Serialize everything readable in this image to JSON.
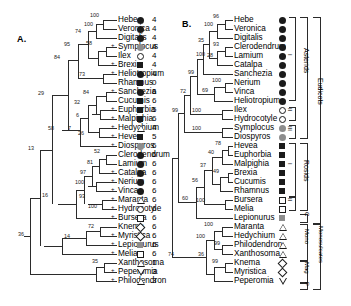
{
  "figure": {
    "panels": [
      {
        "id": "A",
        "label": "A."
      },
      {
        "id": "B",
        "label": "B."
      }
    ]
  },
  "panelA": {
    "label": "A.",
    "taxa": [
      {
        "name": "Hebe",
        "symbol": "filled-circle",
        "code": "4"
      },
      {
        "name": "Veronica",
        "symbol": "filled-circle",
        "code": "4"
      },
      {
        "name": "Digitalis",
        "symbol": "filled-circle",
        "code": "4"
      },
      {
        "name": "Symplocus",
        "symbol": "gray-circle",
        "code": "4"
      },
      {
        "name": "Ilex",
        "symbol": "open-circle",
        "code": "4"
      },
      {
        "name": "Brexia",
        "symbol": "filled-square",
        "code": "4"
      },
      {
        "name": "Heliotropium",
        "symbol": "filled-circle",
        "code": "4"
      },
      {
        "name": "Rhamnus",
        "symbol": "filled-square",
        "code": "0"
      },
      {
        "name": "Sanchezia",
        "symbol": "filled-circle",
        "code": "6"
      },
      {
        "name": "Cucumis",
        "symbol": "filled-square",
        "code": "6"
      },
      {
        "name": "Euphorbia",
        "symbol": "filled-square",
        "code": "5"
      },
      {
        "name": "Malpighia",
        "symbol": "filled-square",
        "code": "6"
      },
      {
        "name": "Hedychium",
        "symbol": "up-triangle",
        "code": "4"
      },
      {
        "name": "Hevea",
        "symbol": "filled-square",
        "code": "5"
      },
      {
        "name": "Diospyros",
        "symbol": "gray-circle",
        "code": "6"
      },
      {
        "name": "Clerodendrum",
        "symbol": "filled-circle",
        "code": "6"
      },
      {
        "name": "Lamium",
        "symbol": "filled-circle",
        "code": "6"
      },
      {
        "name": "Catalpa",
        "symbol": "filled-circle",
        "code": "6"
      },
      {
        "name": "Nerium",
        "symbol": "filled-circle",
        "code": "6"
      },
      {
        "name": "Vinca",
        "symbol": "filled-circle",
        "code": "6"
      },
      {
        "name": "Maranta",
        "symbol": "up-triangle",
        "code": "6"
      },
      {
        "name": "Hydrocotyle",
        "symbol": "open-circle",
        "code": "6"
      },
      {
        "name": "Bursera",
        "symbol": "open-square",
        "code": "6"
      },
      {
        "name": "Knema",
        "symbol": "diamond",
        "code": "6"
      },
      {
        "name": "Myristica",
        "symbol": "diamond",
        "code": "6"
      },
      {
        "name": "Lepionurus",
        "symbol": "gray-square",
        "code": "6"
      },
      {
        "name": "Melia",
        "symbol": "open-square",
        "code": "6"
      },
      {
        "name": "Xanthosoma",
        "symbol": "up-triangle",
        "code": "1"
      },
      {
        "name": "Peperomia",
        "symbol": "down-triangle",
        "code": "3"
      },
      {
        "name": "Philodendron",
        "symbol": "up-triangle",
        "code": "3"
      }
    ],
    "bootstrap": [
      "100",
      "100",
      "74",
      "95",
      "58",
      "84",
      "73",
      "29",
      "84",
      "32",
      "6",
      "7",
      "58",
      "26",
      "13",
      "52",
      "81",
      "97",
      "100",
      "93",
      "100",
      "16",
      "36",
      "72",
      "14",
      "35"
    ]
  },
  "panelB": {
    "label": "B.",
    "taxa": [
      {
        "name": "Hebe",
        "symbol": "filled-circle"
      },
      {
        "name": "Veronica",
        "symbol": "filled-circle"
      },
      {
        "name": "Digitalis",
        "symbol": "filled-circle"
      },
      {
        "name": "Clerodendrum",
        "symbol": "filled-circle"
      },
      {
        "name": "Lamium",
        "symbol": "filled-circle"
      },
      {
        "name": "Catalpa",
        "symbol": "filled-circle"
      },
      {
        "name": "Sanchezia",
        "symbol": "filled-circle"
      },
      {
        "name": "Nerium",
        "symbol": "filled-circle"
      },
      {
        "name": "Vinca",
        "symbol": "filled-circle"
      },
      {
        "name": "Heliotropium",
        "symbol": "filled-circle"
      },
      {
        "name": "Ilex",
        "symbol": "open-circle"
      },
      {
        "name": "Hydrocotyle",
        "symbol": "open-circle"
      },
      {
        "name": "Symplocus",
        "symbol": "gray-circle"
      },
      {
        "name": "Diospyros",
        "symbol": "gray-circle"
      },
      {
        "name": "Hevea",
        "symbol": "filled-square"
      },
      {
        "name": "Euphorbia",
        "symbol": "filled-square"
      },
      {
        "name": "Malpighia",
        "symbol": "filled-square"
      },
      {
        "name": "Brexia",
        "symbol": "filled-square"
      },
      {
        "name": "Cucumis",
        "symbol": "filled-square"
      },
      {
        "name": "Rhamnus",
        "symbol": "filled-square"
      },
      {
        "name": "Bursera",
        "symbol": "open-square"
      },
      {
        "name": "Melia",
        "symbol": "open-square"
      },
      {
        "name": "Lepionurus",
        "symbol": "gray-square"
      },
      {
        "name": "Maranta",
        "symbol": "up-triangle"
      },
      {
        "name": "Hedychium",
        "symbol": "up-triangle"
      },
      {
        "name": "Philodendron",
        "symbol": "up-triangle"
      },
      {
        "name": "Xanthosoma",
        "symbol": "up-triangle"
      },
      {
        "name": "Knema",
        "symbol": "diamond"
      },
      {
        "name": "Myristica",
        "symbol": "diamond"
      },
      {
        "name": "Peperomia",
        "symbol": "down-triangle"
      }
    ],
    "bootstrap": [
      "96",
      "100",
      "35",
      "93",
      "100",
      "28",
      "99",
      "100",
      "69",
      "72",
      "99",
      "100",
      "100",
      "78",
      "40",
      "37",
      "56",
      "49",
      "60",
      "100",
      "74",
      "100",
      "100",
      "99",
      "36",
      "99"
    ],
    "brackets": {
      "asterids": "Asterids",
      "rosids": "Rosids",
      "eudicots": "Eudicots",
      "monosulcates": "Monosulcates",
      "mono": "Mono",
      "mag": "Mag",
      "c": "C",
      "p": "P",
      "roman": [
        "I",
        "II",
        "III",
        "I",
        "II"
      ]
    }
  }
}
